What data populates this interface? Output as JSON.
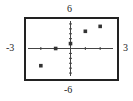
{
  "chart_data": {
    "type": "scatter",
    "title": "",
    "xlabel": "",
    "ylabel": "",
    "xlim": [
      -3,
      3
    ],
    "ylim": [
      -6,
      6
    ],
    "x_tick_step": 1,
    "y_tick_step": 1,
    "grid": false,
    "window_labels": {
      "xmin": "-3",
      "xmax": "3",
      "ymin": "-6",
      "ymax": "6"
    },
    "points": [
      {
        "x": -2,
        "y": -3.5
      },
      {
        "x": -1,
        "y": 0
      },
      {
        "x": 0,
        "y": 1
      },
      {
        "x": 1,
        "y": 3.5
      },
      {
        "x": 2,
        "y": 4.5
      }
    ],
    "colors": {
      "frame": "#222222",
      "axis": "#444444",
      "point": "#333333"
    }
  }
}
